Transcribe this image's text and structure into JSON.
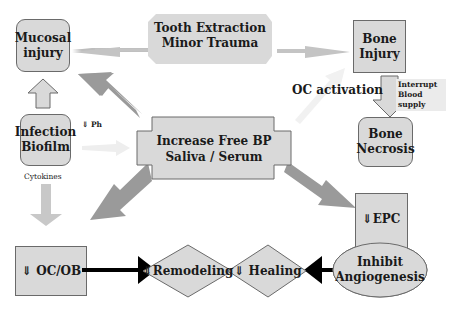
{
  "diagram": {
    "nodes": {
      "mucosal_injury": "Mucosal\ninjury",
      "tooth_extraction": [
        "Tooth Extraction",
        "Minor Trauma"
      ],
      "bone_injury": [
        "Bone",
        "Injury"
      ],
      "infection_biofilm": [
        "Infection",
        "Biofilm"
      ],
      "free_bp": [
        "Increase Free BP",
        "Saliva / Serum"
      ],
      "bone_necrosis": [
        "Bone",
        "Necrosis"
      ],
      "oc_ob": "⇓ OC/OB",
      "remodeling": "⇓Remodeling",
      "healing": "⇓ Healing",
      "epc": "⇓EPC",
      "angiogenesis": [
        "Inhibit",
        "Angiogenesis"
      ]
    },
    "labels": {
      "oc_activation": "OC activation",
      "interrupt_blood_supply": [
        "Interrupt",
        "Blood",
        "supply"
      ],
      "ph": "⇓ Ph",
      "cytokines": "Cytokines"
    },
    "colors": {
      "box_fill": "#d9d9d9",
      "box_border": "#6a6a6a",
      "big_arrow": "#9a9a9a",
      "light_arrow": "#c8c8c8",
      "black_arrow": "#000000"
    }
  }
}
